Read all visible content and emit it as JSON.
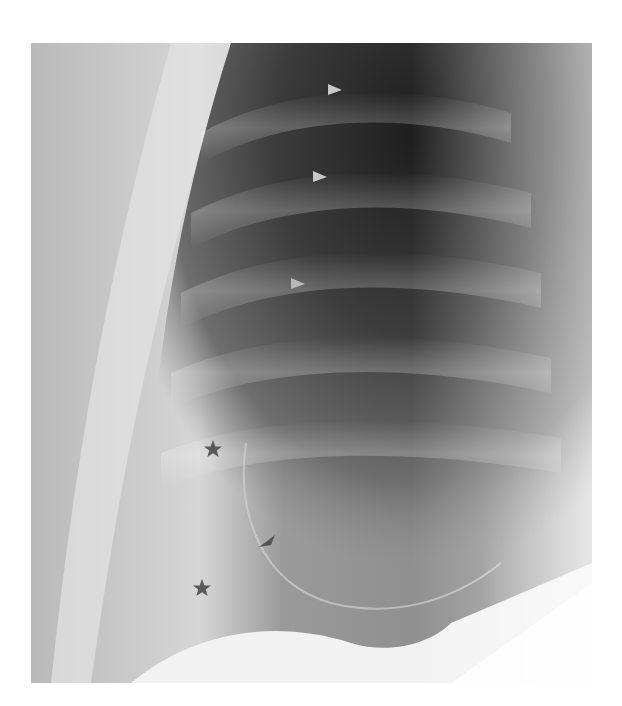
{
  "figure": {
    "type": "radiograph",
    "colors": {
      "background": "#ffffff",
      "lung_dark": "#2a2a2a",
      "soft_tissue": "#b0b0b0",
      "marker_light": "#c8c8c8",
      "marker_dark": "#555555"
    }
  },
  "annotations": [
    {
      "type": "arrowhead",
      "direction": "right",
      "shade": "light",
      "x": 335,
      "y": 90
    },
    {
      "type": "arrowhead",
      "direction": "right",
      "shade": "light",
      "x": 320,
      "y": 177
    },
    {
      "type": "arrowhead",
      "direction": "right",
      "shade": "light",
      "x": 298,
      "y": 284
    },
    {
      "type": "arrowhead",
      "direction": "up-left",
      "shade": "dark",
      "x": 268,
      "y": 542
    },
    {
      "type": "star",
      "shade": "dark",
      "x": 213,
      "y": 449
    },
    {
      "type": "star",
      "shade": "dark",
      "x": 202,
      "y": 588
    }
  ]
}
